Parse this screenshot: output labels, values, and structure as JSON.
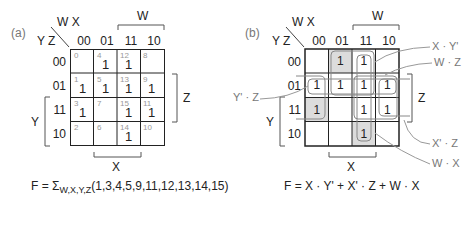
{
  "panel_a": {
    "label": "(a)",
    "col_vars": "W X",
    "row_vars": "Y Z",
    "col_headers": [
      "00",
      "01",
      "11",
      "10"
    ],
    "row_headers": [
      "00",
      "01",
      "11",
      "10"
    ],
    "bracket_labels": {
      "top": "W",
      "right": "Z",
      "left": "Y",
      "bottom": "X"
    },
    "cells": [
      [
        {
          "index": "0",
          "value": ""
        },
        {
          "index": "4",
          "value": "1"
        },
        {
          "index": "12",
          "value": "1"
        },
        {
          "index": "8",
          "value": ""
        }
      ],
      [
        {
          "index": "1",
          "value": "1"
        },
        {
          "index": "5",
          "value": "1"
        },
        {
          "index": "13",
          "value": "1"
        },
        {
          "index": "9",
          "value": "1"
        }
      ],
      [
        {
          "index": "3",
          "value": "1"
        },
        {
          "index": "7",
          "value": ""
        },
        {
          "index": "15",
          "value": "1"
        },
        {
          "index": "11",
          "value": "1"
        }
      ],
      [
        {
          "index": "2",
          "value": ""
        },
        {
          "index": "6",
          "value": ""
        },
        {
          "index": "14",
          "value": "1"
        },
        {
          "index": "10",
          "value": ""
        }
      ]
    ],
    "formula": {
      "lhs": "F = Σ",
      "subscript": "W,X,Y,Z",
      "terms": "(1,3,4,5,9,11,12,13,14,15)"
    }
  },
  "panel_b": {
    "label": "(b)",
    "col_vars": "W X",
    "row_vars": "Y Z",
    "col_headers": [
      "00",
      "01",
      "11",
      "10"
    ],
    "row_headers": [
      "00",
      "01",
      "11",
      "10"
    ],
    "bracket_labels": {
      "top": "W",
      "right": "Z",
      "left": "Y",
      "bottom": "X"
    },
    "cells": [
      [
        "",
        "1",
        "1",
        ""
      ],
      [
        "1",
        "1",
        "1",
        "1"
      ],
      [
        "1",
        "",
        "1",
        "1"
      ],
      [
        "",
        "",
        "1",
        ""
      ]
    ],
    "shaded_cells": [
      [
        0,
        1
      ],
      [
        2,
        0
      ],
      [
        3,
        2
      ]
    ],
    "callouts": {
      "xy": "X · Y'",
      "wz": "W · Z",
      "yz": "Y' · Z",
      "xz": "X' · Z",
      "wx": "W · X"
    },
    "formula": "F = X · Y' + X' · Z + W · X",
    "colors": {
      "shade": "#dcdcdc",
      "group_outline": "#888888",
      "callout_line": "#999999"
    }
  }
}
